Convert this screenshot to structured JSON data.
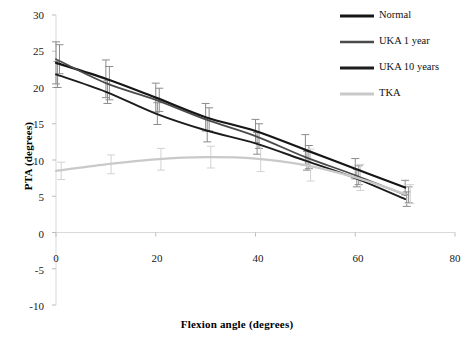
{
  "chart_data": {
    "type": "line",
    "title": "",
    "xlabel": "Flexion angle (degrees)",
    "ylabel": "PTA (degrees)",
    "xlim": [
      0,
      80
    ],
    "ylim": [
      -10,
      30
    ],
    "xticks": [
      0,
      20,
      40,
      60,
      80
    ],
    "yticks": [
      30,
      25,
      20,
      15,
      10,
      5,
      0,
      -5,
      -10
    ],
    "grid": false,
    "legend_position": "top-right",
    "x": [
      0,
      10,
      20,
      30,
      40,
      50,
      60,
      70
    ],
    "series": [
      {
        "name": "Normal",
        "color": "#161616",
        "width": 2.2,
        "values": [
          23.4,
          21.2,
          18.6,
          15.9,
          14.0,
          11.4,
          8.8,
          6.2
        ],
        "errors": [
          2.9,
          2.6,
          2.0,
          1.9,
          1.6,
          2.1,
          1.4,
          1.0
        ]
      },
      {
        "name": "UKA 1 year",
        "color": "#4a4a4a",
        "width": 1.8,
        "values": [
          23.9,
          20.6,
          18.3,
          15.6,
          13.3,
          10.4,
          7.9,
          5.2
        ],
        "errors": [
          2.0,
          2.3,
          1.6,
          1.6,
          1.7,
          1.6,
          1.3,
          1.1
        ]
      },
      {
        "name": "UKA 10 years",
        "color": "#1c1c1c",
        "width": 1.9,
        "values": [
          21.8,
          19.4,
          16.4,
          14.1,
          12.3,
          9.9,
          7.5,
          4.6
        ],
        "errors": [
          1.8,
          1.6,
          1.5,
          1.6,
          1.5,
          1.3,
          1.2,
          1.0
        ]
      },
      {
        "name": "TKA",
        "color": "#c9c9c9",
        "width": 2.2,
        "values": [
          8.5,
          9.4,
          10.1,
          10.4,
          10.2,
          9.3,
          7.6,
          5.3
        ],
        "errors": [
          1.2,
          1.3,
          1.5,
          1.5,
          1.8,
          2.2,
          1.8,
          1.3
        ]
      }
    ],
    "errorbar_color": "#8c8c8c",
    "axis_color": "#d9d9d9",
    "tick_color": "#bdbdbd"
  },
  "legend": {
    "entries": [
      {
        "label": "Normal"
      },
      {
        "label": "UKA 1 year"
      },
      {
        "label": "UKA 10 years"
      },
      {
        "label": "TKA"
      }
    ]
  },
  "ticks": {
    "y": [
      "30",
      "25",
      "20",
      "15",
      "10",
      "5",
      "0",
      "-5",
      "-10"
    ],
    "x": [
      "0",
      "20",
      "40",
      "60",
      "80"
    ]
  }
}
